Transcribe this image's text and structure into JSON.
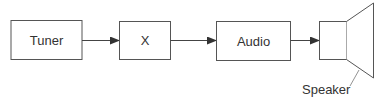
{
  "diagram": {
    "type": "block-diagram",
    "blocks": [
      {
        "id": "tuner",
        "label": "Tuner"
      },
      {
        "id": "x",
        "label": "X"
      },
      {
        "id": "audio",
        "label": "Audio"
      }
    ],
    "speaker_label": "Speaker",
    "edges": [
      {
        "from": "tuner",
        "to": "x"
      },
      {
        "from": "x",
        "to": "audio"
      },
      {
        "from": "audio",
        "to": "speaker"
      }
    ],
    "colors": {
      "stroke": "#555555",
      "text": "#333333",
      "background": "#ffffff"
    }
  }
}
